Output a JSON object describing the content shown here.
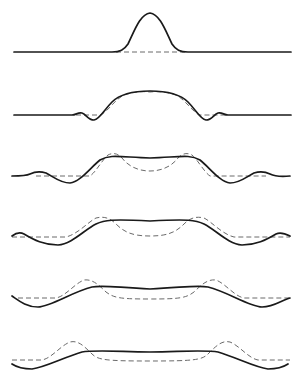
{
  "figure": {
    "type": "diagram",
    "colors": {
      "background": "#ffffff",
      "solid_curve": "#1a1a1a",
      "dashed_curve": "#6a6a6a"
    },
    "legend": [],
    "panels": [
      {
        "index": 1,
        "baseline_y": 52,
        "solid": "gaussian-peak",
        "dashed": "flat-baseline-under-peak"
      },
      {
        "index": 2,
        "baseline_y": 115,
        "solid": "rounded-plateau-with-small-side-dips",
        "dashed": "flat-top-plateau"
      },
      {
        "index": 3,
        "baseline_y": 176,
        "solid": "broad-plateau-with-side-ripples",
        "dashed": "two-humps-central-dip"
      },
      {
        "index": 4,
        "baseline_y": 237,
        "solid": "wider-plateau-with-side-ripples",
        "dashed": "two-humps-wider-separation"
      },
      {
        "index": 5,
        "baseline_y": 298,
        "solid": "very-wide-flat-plateau",
        "dashed": "two-humps-far-apart"
      },
      {
        "index": 6,
        "baseline_y": 360,
        "solid": "widest-flat-plateau",
        "dashed": "two-humps-farthest-apart"
      }
    ]
  }
}
